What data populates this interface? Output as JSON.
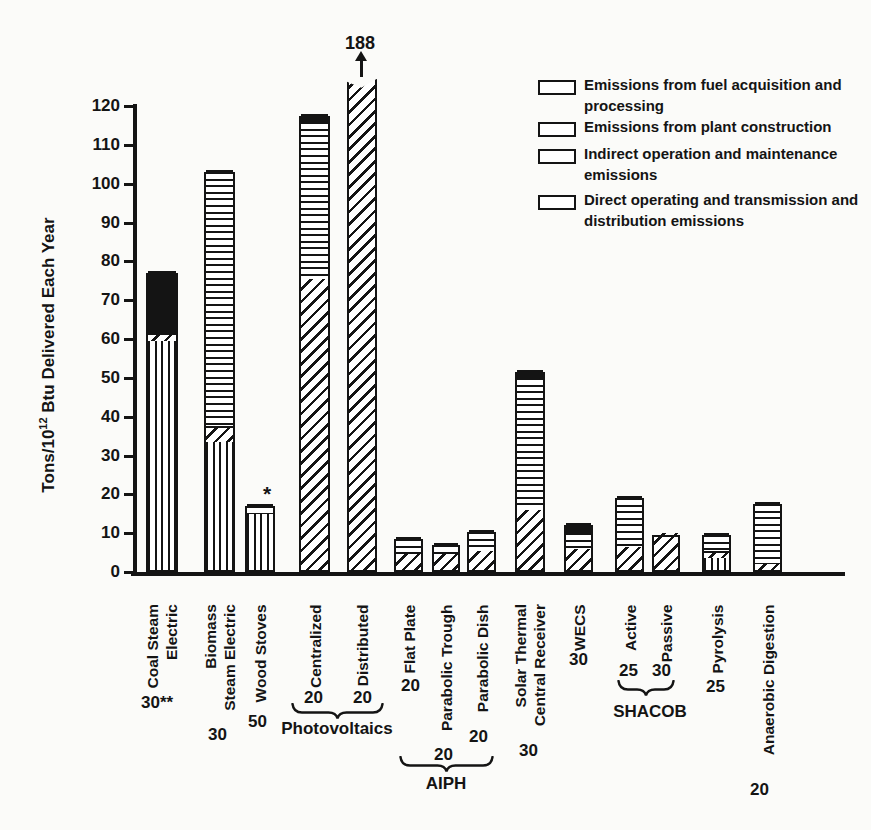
{
  "figure": {
    "background": "#fbfbf9",
    "ink": "#141414"
  },
  "chart_data": {
    "type": "bar",
    "stacked": true,
    "ylabel": {
      "prefix": "Tons/10",
      "superscript": "12",
      "suffix": " Btu Delivered Each Year"
    },
    "y_axis": {
      "min": 0,
      "max": 120,
      "tick_step": 10,
      "ticks": [
        0,
        10,
        20,
        30,
        40,
        50,
        60,
        70,
        80,
        90,
        100,
        110,
        120
      ]
    },
    "grid": false,
    "legend_position": "top-right",
    "legend": [
      {
        "key": "fuel",
        "pattern": "vertical-stripes",
        "label": "Emissions from fuel acquisition and processing",
        "swatch_y": 80,
        "text_y": 74
      },
      {
        "key": "construction",
        "pattern": "diagonal-stripes",
        "label": "Emissions from plant construction",
        "swatch_y": 122,
        "text_y": 116
      },
      {
        "key": "indirect",
        "pattern": "horizontal-stripes",
        "label": "Indirect operation and maintenance emissions",
        "swatch_y": 149,
        "text_y": 143
      },
      {
        "key": "direct",
        "pattern": "solid-black",
        "label": "Direct operating and transmission and distribution emissions",
        "swatch_y": 195,
        "text_y": 189
      }
    ],
    "bars": [
      {
        "id": "coal-steam-electric",
        "label_lines": [
          "Coal Steam",
          "Electric"
        ],
        "note": "30**",
        "total": 77,
        "segments": [
          {
            "key": "fuel",
            "value": 59
          },
          {
            "key": "construction",
            "value": 2
          },
          {
            "key": "direct",
            "value": 16
          }
        ],
        "x": 146,
        "w": 32,
        "note_x": 141,
        "note_y": 693
      },
      {
        "id": "biomass-steam-electric",
        "label_lines": [
          "Biomass",
          "Steam Electric"
        ],
        "note": "30",
        "total": 103,
        "segments": [
          {
            "key": "fuel",
            "value": 33
          },
          {
            "key": "construction",
            "value": 4
          },
          {
            "key": "indirect",
            "value": 66
          }
        ],
        "x": 204,
        "w": 31,
        "note_x": 208,
        "note_y": 725
      },
      {
        "id": "wood-stoves",
        "label_lines": [
          "Wood Stoves"
        ],
        "note": "50",
        "total": 17,
        "segments": [
          {
            "key": "fuel",
            "value": 14.5
          },
          {
            "key": "indirect",
            "value": 2.5
          }
        ],
        "x": 245,
        "w": 30,
        "note_x": 248,
        "note_y": 712
      },
      {
        "id": "photovoltaics-centralized",
        "label_lines": [
          "Centralized"
        ],
        "note": "20",
        "total": 117.5,
        "segments": [
          {
            "key": "construction",
            "value": 75
          },
          {
            "key": "indirect",
            "value": 41
          },
          {
            "key": "direct",
            "value": 1.5
          }
        ],
        "x": 299,
        "w": 31,
        "note_x": 304,
        "note_y": 688
      },
      {
        "id": "photovoltaics-distributed",
        "label_lines": [
          "Distributed"
        ],
        "note": "20",
        "total": 188,
        "truncated": true,
        "drawn_value": 127,
        "annotation": "188",
        "segments": [
          {
            "key": "construction",
            "value": 188
          }
        ],
        "x": 347,
        "w": 30,
        "note_x": 353,
        "note_y": 688
      },
      {
        "id": "aiph-flat-plate",
        "label_lines": [
          "Flat Plate"
        ],
        "note": "20",
        "total": 8.5,
        "segments": [
          {
            "key": "construction",
            "value": 4
          },
          {
            "key": "indirect",
            "value": 4.5
          }
        ],
        "x": 394,
        "w": 29,
        "note_x": 401,
        "note_y": 676
      },
      {
        "id": "aiph-parabolic-trough",
        "label_lines": [
          "Parabolic Trough"
        ],
        "note": "20",
        "total": 7,
        "segments": [
          {
            "key": "construction",
            "value": 4
          },
          {
            "key": "indirect",
            "value": 3
          }
        ],
        "x": 432,
        "w": 28,
        "note_x": 434,
        "note_y": 745
      },
      {
        "id": "aiph-parabolic-dish",
        "label_lines": [
          "Parabolic Dish"
        ],
        "note": "20",
        "total": 10.3,
        "segments": [
          {
            "key": "construction",
            "value": 5
          },
          {
            "key": "indirect",
            "value": 5.3
          }
        ],
        "x": 467,
        "w": 29,
        "note_x": 469,
        "note_y": 727
      },
      {
        "id": "solar-thermal-central-receiver",
        "label_lines": [
          "Solar Thermal",
          "Central Receiver"
        ],
        "note": "30",
        "total": 51.5,
        "segments": [
          {
            "key": "construction",
            "value": 15.5
          },
          {
            "key": "indirect",
            "value": 34.5
          },
          {
            "key": "direct",
            "value": 1.5
          }
        ],
        "x": 515,
        "w": 30,
        "note_x": 519,
        "note_y": 741
      },
      {
        "id": "wecs",
        "label_lines": [
          "WECS"
        ],
        "note": "30",
        "total": 12,
        "segments": [
          {
            "key": "construction",
            "value": 5.5
          },
          {
            "key": "indirect",
            "value": 4.5
          },
          {
            "key": "direct",
            "value": 2
          }
        ],
        "x": 564,
        "w": 29,
        "note_x": 569,
        "note_y": 650
      },
      {
        "id": "shacob-active",
        "label_lines": [
          "Active"
        ],
        "note": "25",
        "total": 19,
        "segments": [
          {
            "key": "construction",
            "value": 6
          },
          {
            "key": "indirect",
            "value": 13
          }
        ],
        "x": 615,
        "w": 29,
        "note_x": 619,
        "note_y": 661
      },
      {
        "id": "shacob-passive",
        "label_lines": [
          "Passive"
        ],
        "note": "30",
        "total": 9.5,
        "segments": [
          {
            "key": "construction",
            "value": 9.5
          }
        ],
        "x": 652,
        "w": 28,
        "note_x": 652,
        "note_y": 661
      },
      {
        "id": "pyrolysis",
        "label_lines": [
          "Pyrolysis"
        ],
        "note": "25",
        "total": 9.5,
        "segments": [
          {
            "key": "fuel",
            "value": 3
          },
          {
            "key": "construction",
            "value": 2
          },
          {
            "key": "indirect",
            "value": 4.5
          }
        ],
        "x": 702,
        "w": 29,
        "note_x": 706,
        "note_y": 677
      },
      {
        "id": "anaerobic-digestion",
        "label_lines": [
          "Anaerobic Digestion"
        ],
        "note": "20",
        "total": 17.5,
        "segments": [
          {
            "key": "construction",
            "value": 1.5
          },
          {
            "key": "indirect",
            "value": 16
          }
        ],
        "x": 753,
        "w": 29,
        "note_x": 750,
        "note_y": 780
      }
    ],
    "braces": [
      {
        "id": "photovoltaics",
        "label": "Photovoltaics",
        "x": 291,
        "y": 703,
        "width": 93,
        "label_cx": 337,
        "label_y": 719
      },
      {
        "id": "aiph",
        "label": "AIPH",
        "x": 399,
        "y": 756,
        "width": 95,
        "label_cx": 446,
        "label_y": 774
      },
      {
        "id": "shacob",
        "label": "SHACOB",
        "x": 617,
        "y": 680,
        "width": 58,
        "label_cx": 650,
        "label_y": 702
      }
    ],
    "annotations": [
      {
        "id": "truncation-value",
        "text": "188",
        "x": 345,
        "y": 33,
        "size": 18
      },
      {
        "id": "wood-stoves-asterisk",
        "text": "*",
        "x": 263,
        "y": 482,
        "size": 21
      }
    ]
  },
  "geometry": {
    "px_per_unit": 3.883,
    "baseline_y": 572,
    "axis_x": 133,
    "axis_top_y": 104,
    "baseline_x2": 845,
    "xlabel_top_y": 604,
    "xlabel_line_height": 19
  }
}
